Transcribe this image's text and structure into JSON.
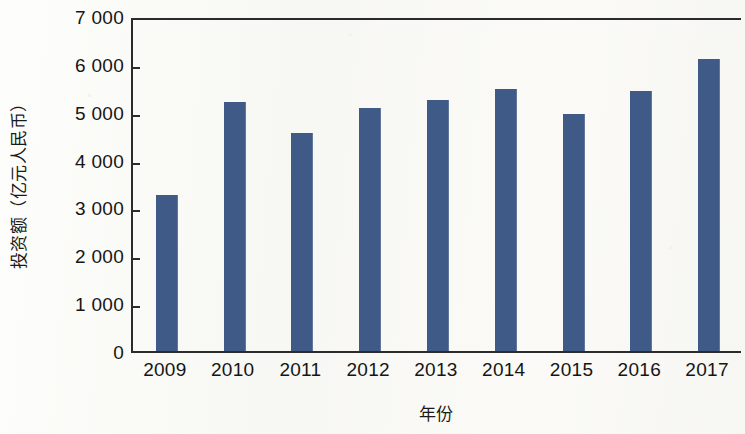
{
  "chart_data": {
    "type": "bar",
    "title": "",
    "xlabel": "年份",
    "ylabel": "投资额（亿元人民币）",
    "categories": [
      "2009",
      "2010",
      "2011",
      "2012",
      "2013",
      "2014",
      "2015",
      "2016",
      "2017"
    ],
    "values": [
      3250,
      5200,
      4550,
      5080,
      5250,
      5480,
      4960,
      5430,
      6100
    ],
    "series": [
      {
        "name": "投资额",
        "values": [
          3250,
          5200,
          4550,
          5080,
          5250,
          5480,
          4960,
          5430,
          6100
        ]
      }
    ],
    "ylim": [
      0,
      7000
    ],
    "ytick_values": [
      0,
      1000,
      2000,
      3000,
      4000,
      5000,
      6000,
      7000
    ],
    "ytick_labels": [
      "0",
      "1 000",
      "2 000",
      "3 000",
      "4 000",
      "5 000",
      "6 000",
      "7 000"
    ],
    "grid": false,
    "legend": false,
    "legend_position": "none",
    "bar_color": "#3f5a87",
    "axis_color": "#2b2b2b",
    "background_color": "#fbfbf9"
  }
}
